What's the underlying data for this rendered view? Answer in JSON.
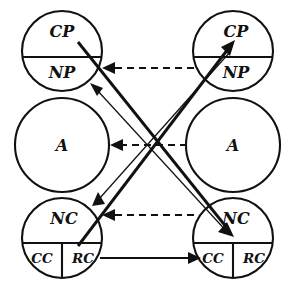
{
  "diagram": {
    "type": "ego-state-transaction",
    "stroke_color": "#111111",
    "background_color": "#ffffff",
    "persons": [
      {
        "id": "left",
        "side": "left",
        "center_x": 62,
        "circles": [
          {
            "id": "left-parent",
            "name": "Parent",
            "center_y": 51,
            "radius": 40,
            "split": "horizontal",
            "segments": [
              {
                "id": "left-cp",
                "label": "CP",
                "meaning": "Critical Parent",
                "position": "upper"
              },
              {
                "id": "left-np",
                "label": "NP",
                "meaning": "Nurturing Parent",
                "position": "lower"
              }
            ]
          },
          {
            "id": "left-adult",
            "name": "Adult",
            "center_y": 145,
            "radius": 47,
            "split": "none",
            "segments": [
              {
                "id": "left-a",
                "label": "A",
                "meaning": "Adult",
                "position": "center"
              }
            ]
          },
          {
            "id": "left-child",
            "name": "Child",
            "center_y": 238,
            "radius": 40,
            "split": "horizontal-and-vertical-lower",
            "segments": [
              {
                "id": "left-nc",
                "label": "NC",
                "meaning": "Natural Child",
                "position": "upper"
              },
              {
                "id": "left-cc",
                "label": "CC",
                "meaning": "Compliant Child",
                "position": "lower-left"
              },
              {
                "id": "left-rc",
                "label": "RC",
                "meaning": "Rebellious Child",
                "position": "lower-right"
              }
            ]
          }
        ]
      },
      {
        "id": "right",
        "side": "right",
        "center_x": 233,
        "circles": [
          {
            "id": "right-parent",
            "name": "Parent",
            "center_y": 51,
            "radius": 40,
            "split": "horizontal",
            "segments": [
              {
                "id": "right-cp",
                "label": "CP",
                "meaning": "Critical Parent",
                "position": "upper"
              },
              {
                "id": "right-np",
                "label": "NP",
                "meaning": "Nurturing Parent",
                "position": "lower"
              }
            ]
          },
          {
            "id": "right-adult",
            "name": "Adult",
            "center_y": 145,
            "radius": 47,
            "split": "none",
            "segments": [
              {
                "id": "right-a",
                "label": "A",
                "meaning": "Adult",
                "position": "center"
              }
            ]
          },
          {
            "id": "right-child",
            "name": "Child",
            "center_y": 238,
            "radius": 40,
            "split": "horizontal-and-vertical-lower",
            "segments": [
              {
                "id": "right-nc",
                "label": "NC",
                "meaning": "Natural Child",
                "position": "upper"
              },
              {
                "id": "right-cc",
                "label": "CC",
                "meaning": "Compliant Child",
                "position": "lower-left"
              },
              {
                "id": "right-rc",
                "label": "RC",
                "meaning": "Rebellious Child",
                "position": "lower-right"
              }
            ]
          }
        ]
      }
    ],
    "transactions": [
      {
        "id": "t-np-to-np",
        "style": "dashed",
        "direction": "right-to-left",
        "from": "right-np",
        "to": "left-np",
        "x1": 194,
        "y1": 68,
        "x2": 104,
        "y2": 68
      },
      {
        "id": "t-a-to-a",
        "style": "dashed",
        "direction": "right-to-left",
        "from": "right-a",
        "to": "left-a",
        "x1": 187,
        "y1": 145,
        "x2": 112,
        "y2": 145
      },
      {
        "id": "t-nc-to-nc",
        "style": "dashed",
        "direction": "right-to-left",
        "from": "right-nc",
        "to": "left-nc",
        "x1": 194,
        "y1": 215,
        "x2": 104,
        "y2": 215
      },
      {
        "id": "t-cc-to-cc",
        "style": "solid-thin",
        "direction": "left-to-right",
        "from": "left-rc",
        "to": "right-cc",
        "x1": 100,
        "y1": 258,
        "x2": 199,
        "y2": 258
      },
      {
        "id": "t-cross-nc-to-cp",
        "style": "solid-thick",
        "direction": "lower-left-to-upper-right",
        "from": "left-nc",
        "to": "right-cp",
        "x1": 80,
        "y1": 244,
        "x2": 232,
        "y2": 45
      },
      {
        "id": "t-cross-cp-to-nc",
        "style": "solid-thick",
        "direction": "upper-left-to-lower-right",
        "from": "left-cp",
        "to": "right-nc",
        "x1": 78,
        "y1": 42,
        "x2": 231,
        "y2": 232
      },
      {
        "id": "t-cross-rc-to-np-boundary",
        "style": "solid-thin",
        "direction": "lower-right-to-upper-left",
        "from": "right-nc",
        "to": "left-np",
        "x1": 229,
        "y1": 234,
        "x2": 92,
        "y2": 85
      },
      {
        "id": "t-cross-np-to-nc-boundary",
        "style": "solid-thin",
        "direction": "upper-right-to-lower-left",
        "from": "right-np",
        "to": "left-nc",
        "x1": 230,
        "y1": 50,
        "x2": 94,
        "y2": 203
      }
    ]
  }
}
